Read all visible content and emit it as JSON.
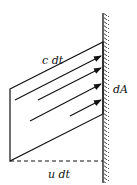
{
  "diagram": {
    "labels": {
      "slant_length": "c dt",
      "area": "dA",
      "base_length": "u dt"
    },
    "colors": {
      "stroke": "#111111",
      "background": "#ffffff"
    }
  }
}
